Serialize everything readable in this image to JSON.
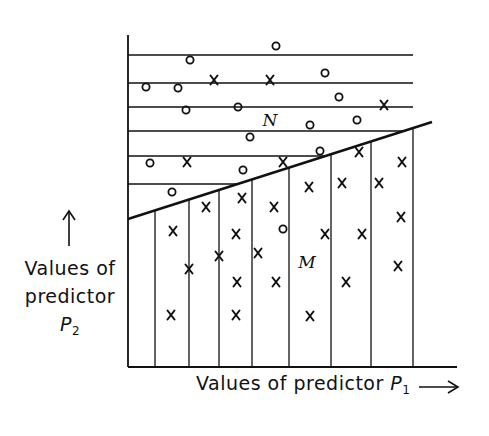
{
  "diagram": {
    "title": "",
    "region_labels": {
      "upper": "N",
      "lower": "M"
    },
    "y_axis_label": {
      "line1": "Values of",
      "line2": "predictor",
      "symbol": "P",
      "subscript": "2",
      "arrow": "up"
    },
    "x_axis_label": {
      "text": "Values of predictor",
      "symbol": "P",
      "subscript": "1",
      "arrow": "right"
    },
    "colors": {
      "ink": "#111111",
      "background": "#ffffff"
    },
    "geometry": {
      "y_axis": {
        "x": 128,
        "y_top": 35,
        "y_bottom": 367
      },
      "x_axis": {
        "y": 367,
        "x_left": 128,
        "x_right": 457
      },
      "horizontal_lines_y": [
        55,
        83,
        107,
        131,
        156,
        184
      ],
      "horizontal_lines_x_end": 413,
      "vertical_lines_x": [
        155,
        189,
        219,
        252,
        289,
        331,
        371,
        413
      ],
      "boundary_line": {
        "x1": 128,
        "y1": 219,
        "x2": 432,
        "y2": 122
      }
    },
    "markers": [
      {
        "type": "o",
        "x": 276,
        "y": 46
      },
      {
        "type": "o",
        "x": 190,
        "y": 60
      },
      {
        "type": "o",
        "x": 146,
        "y": 87
      },
      {
        "type": "o",
        "x": 178,
        "y": 88
      },
      {
        "type": "x",
        "x": 214,
        "y": 80
      },
      {
        "type": "x",
        "x": 270,
        "y": 80
      },
      {
        "type": "o",
        "x": 325,
        "y": 73
      },
      {
        "type": "o",
        "x": 186,
        "y": 110
      },
      {
        "type": "o",
        "x": 238,
        "y": 107
      },
      {
        "type": "o",
        "x": 339,
        "y": 97
      },
      {
        "type": "x",
        "x": 384,
        "y": 105
      },
      {
        "type": "o",
        "x": 310,
        "y": 125
      },
      {
        "type": "o",
        "x": 357,
        "y": 120
      },
      {
        "type": "o",
        "x": 250,
        "y": 137
      },
      {
        "type": "o",
        "x": 150,
        "y": 163
      },
      {
        "type": "x",
        "x": 187,
        "y": 162
      },
      {
        "type": "o",
        "x": 243,
        "y": 170
      },
      {
        "type": "x",
        "x": 283,
        "y": 162
      },
      {
        "type": "o",
        "x": 320,
        "y": 151
      },
      {
        "type": "x",
        "x": 359,
        "y": 152
      },
      {
        "type": "o",
        "x": 172,
        "y": 192
      },
      {
        "type": "x",
        "x": 206,
        "y": 207
      },
      {
        "type": "x",
        "x": 242,
        "y": 198
      },
      {
        "type": "x",
        "x": 274,
        "y": 207
      },
      {
        "type": "x",
        "x": 309,
        "y": 187
      },
      {
        "type": "x",
        "x": 342,
        "y": 183
      },
      {
        "type": "x",
        "x": 379,
        "y": 183
      },
      {
        "type": "x",
        "x": 402,
        "y": 162
      },
      {
        "type": "x",
        "x": 401,
        "y": 217
      },
      {
        "type": "x",
        "x": 325,
        "y": 234
      },
      {
        "type": "x",
        "x": 362,
        "y": 234
      },
      {
        "type": "x",
        "x": 173,
        "y": 231
      },
      {
        "type": "x",
        "x": 236,
        "y": 234
      },
      {
        "type": "o",
        "x": 283,
        "y": 229
      },
      {
        "type": "x",
        "x": 219,
        "y": 256
      },
      {
        "type": "x",
        "x": 258,
        "y": 253
      },
      {
        "type": "x",
        "x": 189,
        "y": 269
      },
      {
        "type": "x",
        "x": 237,
        "y": 282
      },
      {
        "type": "x",
        "x": 276,
        "y": 282
      },
      {
        "type": "x",
        "x": 346,
        "y": 282
      },
      {
        "type": "x",
        "x": 398,
        "y": 266
      },
      {
        "type": "x",
        "x": 171,
        "y": 315
      },
      {
        "type": "x",
        "x": 236,
        "y": 315
      },
      {
        "type": "x",
        "x": 310,
        "y": 316
      }
    ],
    "label_positions": {
      "N": {
        "x": 270,
        "y": 120
      },
      "M": {
        "x": 307,
        "y": 262
      }
    }
  }
}
